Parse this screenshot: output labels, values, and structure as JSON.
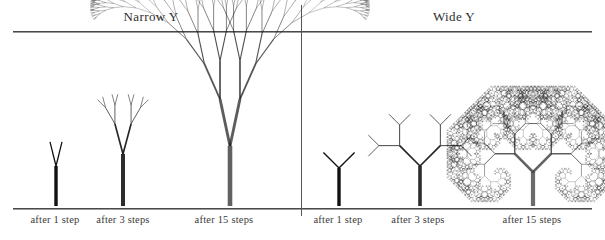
{
  "figure": {
    "panels": [
      {
        "id": "narrow-y",
        "title": "Narrow Y",
        "branch_angle_deg": 10,
        "stages": [
          {
            "steps": 1,
            "caption": "after 1 step"
          },
          {
            "steps": 3,
            "caption": "after 3 steps"
          },
          {
            "steps": 15,
            "caption": "after 15 steps"
          }
        ]
      },
      {
        "id": "wide-y",
        "title": "Wide Y",
        "branch_angle_deg": 45,
        "stages": [
          {
            "steps": 1,
            "caption": "after 1 step"
          },
          {
            "steps": 3,
            "caption": "after 3 steps"
          },
          {
            "steps": 15,
            "caption": "after 15 steps"
          }
        ]
      }
    ],
    "colors": {
      "ink": "#111111",
      "rule": "#4a4a4a",
      "divider": "#555555",
      "background": "#ffffff",
      "caption_text": "#3a3a3a"
    }
  },
  "chart_data": {
    "type": "diagram",
    "panel_labels": [
      "Narrow Y",
      "Wide Y"
    ],
    "stage_labels": [
      "after 1 step",
      "after 3 steps",
      "after 15 steps"
    ],
    "series": [
      {
        "name": "Narrow Y",
        "branch_angle_deg": 10,
        "length_ratio": 0.78,
        "steps": [
          1,
          3,
          15
        ],
        "branch_counts": [
          2,
          8,
          32768
        ],
        "canopy_shape": "fan / mushroom cap"
      },
      {
        "name": "Wide Y",
        "branch_angle_deg": 45,
        "length_ratio": 0.72,
        "steps": [
          1,
          3,
          15
        ],
        "branch_counts": [
          2,
          8,
          32768
        ],
        "canopy_shape": "octagonal cloud with spiral scrolls"
      }
    ],
    "xlabel": "",
    "ylabel": "",
    "legend": "none",
    "grid": false
  }
}
